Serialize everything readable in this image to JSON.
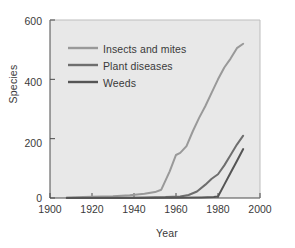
{
  "chart_data": {
    "type": "line",
    "title": "",
    "xlabel": "Year",
    "ylabel": "Species",
    "xlim": [
      1900,
      2000
    ],
    "ylim": [
      0,
      600
    ],
    "xticks": [
      "1900",
      "1920",
      "1940",
      "1960",
      "1980",
      "2000"
    ],
    "yticks": [
      "0",
      "200",
      "400",
      "600"
    ],
    "grid": false,
    "legend_position": "upper-left-inside",
    "background_color": "#e8e8e8",
    "page_background": "#ffffff",
    "series": [
      {
        "name": "Insects and mites",
        "color": "#999999",
        "x": [
          1908,
          1920,
          1930,
          1938,
          1945,
          1950,
          1953,
          1957,
          1960,
          1962,
          1965,
          1968,
          1971,
          1974,
          1977,
          1980,
          1983,
          1986,
          1989,
          1992
        ],
        "values": [
          2,
          4,
          6,
          9,
          14,
          20,
          28,
          90,
          145,
          152,
          175,
          225,
          270,
          310,
          355,
          400,
          440,
          470,
          505,
          520
        ]
      },
      {
        "name": "Plant diseases",
        "color": "#6e6e6e",
        "x": [
          1908,
          1930,
          1945,
          1955,
          1962,
          1966,
          1970,
          1974,
          1977,
          1980,
          1983,
          1986,
          1989,
          1992
        ],
        "values": [
          0,
          1,
          2,
          3,
          5,
          10,
          22,
          45,
          65,
          80,
          110,
          145,
          180,
          210
        ]
      },
      {
        "name": "Weeds",
        "color": "#555555",
        "x": [
          1908,
          1940,
          1960,
          1972,
          1978,
          1980,
          1983,
          1986,
          1989,
          1992
        ],
        "values": [
          0,
          0,
          1,
          2,
          3,
          5,
          45,
          85,
          125,
          165
        ]
      }
    ]
  },
  "legend": {
    "items": [
      {
        "label": "Insects and mites"
      },
      {
        "label": "Plant diseases"
      },
      {
        "label": "Weeds"
      }
    ]
  }
}
